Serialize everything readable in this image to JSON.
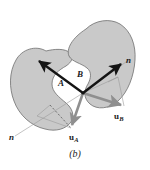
{
  "figure": {
    "caption": "(b)",
    "background_color": "#ffffff",
    "body_fill_color": "#c9c9c9",
    "body_stroke_color": "#6e6e6e",
    "vector_dark_color": "#141414",
    "vector_gray_color": "#8a8a8a",
    "thin_line_color": "#9a9a9a",
    "labels": {
      "point_a": "A",
      "point_b": "B",
      "normal_left": "n",
      "normal_right": "n",
      "velocity_a": "u",
      "velocity_a_sub": "A",
      "velocity_b": "u",
      "velocity_b_sub": "B"
    },
    "bodies": [
      {
        "name": "body-a",
        "path": "M 46 51 C 36 45, 22 49, 16 60 C 9 72, 9 88, 14 101 C 19 115, 31 126, 45 129 C 56 132, 66 129, 71 122 C 75 115, 72 108, 66 103 C 59 97, 52 92, 52 84 C 52 75, 59 70, 66 66 C 72 62, 74 57, 70 53 C 65 48, 54 49, 46 51 Z"
      },
      {
        "name": "body-b",
        "path": "M 86 29 C 95 20, 110 18, 120 24 C 131 31, 136 45, 135 60 C 134 76, 128 92, 118 101 C 109 109, 97 110, 90 104 C 83 98, 84 90, 88 84 C 91 78, 92 72, 87 68 C 81 63, 72 62, 69 56 C 66 49, 72 38, 86 29 Z"
      }
    ],
    "vectors": [
      {
        "name": "vector-normal-a",
        "x1": 83,
        "y1": 93,
        "x2": 37,
        "y2": 60,
        "style": "dark-arrow"
      },
      {
        "name": "vector-normal-b",
        "x1": 83,
        "y1": 93,
        "x2": 123,
        "y2": 62,
        "style": "dark-arrow"
      },
      {
        "name": "vector-velocity-a",
        "x1": 83,
        "y1": 93,
        "x2": 71,
        "y2": 128,
        "style": "gray-arrow"
      },
      {
        "name": "vector-velocity-b",
        "x1": 83,
        "y1": 93,
        "x2": 124,
        "y2": 106,
        "style": "gray-arrow"
      }
    ],
    "thin_lines": [
      {
        "name": "normal-line-left",
        "x1": 83,
        "y1": 93,
        "x2": 15,
        "y2": 136
      },
      {
        "name": "normal-line-right",
        "x1": 83,
        "y1": 93,
        "x2": 130,
        "y2": 59
      },
      {
        "name": "construction-a-1",
        "x1": 37,
        "y1": 116,
        "x2": 71,
        "y2": 128
      },
      {
        "name": "construction-a-2",
        "x1": 37,
        "y1": 116,
        "x2": 50,
        "y2": 105
      },
      {
        "name": "construction-b-1",
        "x1": 118,
        "y1": 77,
        "x2": 124,
        "y2": 106
      },
      {
        "name": "construction-b-2",
        "x1": 118,
        "y1": 77,
        "x2": 108,
        "y2": 82
      }
    ]
  }
}
